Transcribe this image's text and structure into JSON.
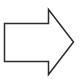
{
  "shape": {
    "type": "right-arrow",
    "icon": "arrow-right-icon",
    "stroke": "#2b2b2b",
    "fill": "#ffffff",
    "background": "#ffffff",
    "stroke_width": 1.5,
    "points": "4.5,23.5 48.5,23.5 48.5,9.5 73.5,42 48.5,74.5 48.5,61.5 4.5,61.5"
  }
}
